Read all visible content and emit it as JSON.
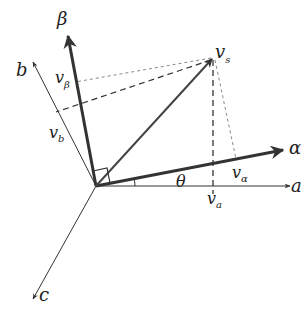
{
  "diagram": {
    "type": "vector-transformation",
    "colors": {
      "axis": "#333333",
      "bold_axis": "#333333",
      "dashed": "#333333",
      "light_dashed": "#888888",
      "background": "#ffffff"
    },
    "origin": [
      96,
      186
    ],
    "axes": [
      {
        "id": "a",
        "label": "a",
        "tip": [
          290,
          186
        ],
        "weight": "thin"
      },
      {
        "id": "b",
        "label": "b",
        "tip": [
          33,
          62
        ],
        "weight": "thin"
      },
      {
        "id": "c",
        "label": "c",
        "tip": [
          33,
          299
        ],
        "weight": "thin"
      },
      {
        "id": "alpha",
        "label": "α",
        "tip": [
          283,
          150
        ],
        "weight": "bold"
      },
      {
        "id": "beta",
        "label": "β",
        "tip": [
          68,
          36
        ],
        "weight": "bold"
      }
    ],
    "vector": {
      "label": "v",
      "subscript": "s",
      "tip": [
        213,
        58
      ]
    },
    "projections": [
      {
        "label": "v",
        "subscript": "a",
        "point": [
          213,
          186
        ],
        "style": "dashed"
      },
      {
        "label": "v",
        "subscript": "b",
        "point": [
          56,
          112
        ],
        "style": "dashed"
      },
      {
        "label": "v",
        "subscript": "α",
        "point": [
          236,
          159
        ],
        "style": "light-dashed"
      },
      {
        "label": "v",
        "subscript": "β",
        "point": [
          75,
          82
        ],
        "style": "light-dashed"
      }
    ],
    "angle": {
      "label": "θ",
      "between": [
        "a",
        "alpha"
      ]
    },
    "right_angle_marker": {
      "between": [
        "alpha",
        "beta"
      ]
    }
  }
}
